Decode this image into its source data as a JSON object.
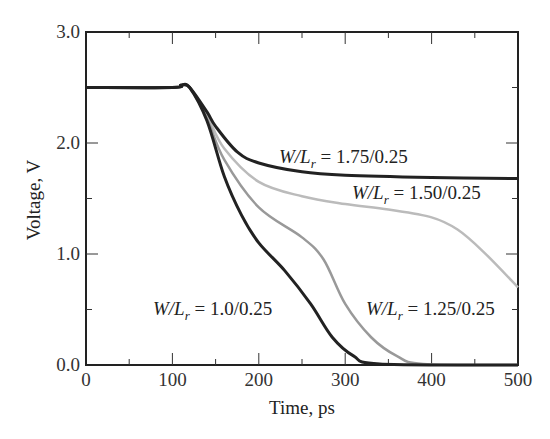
{
  "chart_data": {
    "type": "line",
    "title": "",
    "xlabel": "Time, ps",
    "ylabel": "Voltage, V",
    "xlim": [
      0,
      500
    ],
    "ylim": [
      0,
      3.0
    ],
    "xticks": [
      "0",
      "100",
      "200",
      "300",
      "400",
      "500"
    ],
    "yticks": [
      "0.0",
      "1.0",
      "2.0",
      "3.0"
    ],
    "grid": false,
    "legend": "inline labels",
    "series": [
      {
        "name": "W/Lr = 1.75/0.25",
        "color": "#222222",
        "x": [
          0,
          100,
          110,
          120,
          140,
          150,
          175,
          200,
          250,
          300,
          400,
          500
        ],
        "y": [
          2.5,
          2.5,
          2.52,
          2.5,
          2.28,
          2.15,
          1.92,
          1.82,
          1.74,
          1.71,
          1.69,
          1.68
        ]
      },
      {
        "name": "W/Lr = 1.50/0.25",
        "color": "#bbbbbb",
        "x": [
          0,
          100,
          110,
          120,
          140,
          160,
          200,
          250,
          300,
          350,
          400,
          430,
          460,
          500
        ],
        "y": [
          2.5,
          2.5,
          2.52,
          2.5,
          2.25,
          1.95,
          1.65,
          1.52,
          1.45,
          1.4,
          1.33,
          1.22,
          1.02,
          0.7
        ]
      },
      {
        "name": "W/Lr = 1.25/0.25",
        "color": "#999999",
        "x": [
          0,
          100,
          110,
          120,
          140,
          160,
          200,
          250,
          275,
          300,
          330,
          360,
          390,
          500
        ],
        "y": [
          2.5,
          2.5,
          2.52,
          2.5,
          2.22,
          1.85,
          1.42,
          1.15,
          0.95,
          0.55,
          0.25,
          0.08,
          0.01,
          0.0
        ]
      },
      {
        "name": "W/Lr = 1.0/0.25",
        "color": "#222222",
        "x": [
          0,
          100,
          110,
          120,
          140,
          160,
          180,
          200,
          230,
          260,
          285,
          310,
          340,
          500
        ],
        "y": [
          2.5,
          2.5,
          2.52,
          2.5,
          2.2,
          1.7,
          1.35,
          1.1,
          0.85,
          0.55,
          0.25,
          0.08,
          0.01,
          0.0
        ]
      }
    ],
    "annotations": [
      {
        "text": "W/Lr = 1.75/0.25",
        "near_series": 0
      },
      {
        "text": "W/Lr = 1.50/0.25",
        "near_series": 1
      },
      {
        "text": "W/Lr = 1.25/0.25",
        "near_series": 2
      },
      {
        "text": "W/Lr = 1.0/0.25",
        "near_series": 3
      }
    ]
  },
  "labels": {
    "xlabel": "Time, ps",
    "ylabel": "Voltage, V",
    "curves": [
      {
        "prefix": "W/L",
        "sub": "r",
        "value": " = 1.75/0.25"
      },
      {
        "prefix": "W/L",
        "sub": "r",
        "value": " = 1.50/0.25"
      },
      {
        "prefix": "W/L",
        "sub": "r",
        "value": " = 1.25/0.25"
      },
      {
        "prefix": "W/L",
        "sub": "r",
        "value": " = 1.0/0.25"
      }
    ]
  }
}
